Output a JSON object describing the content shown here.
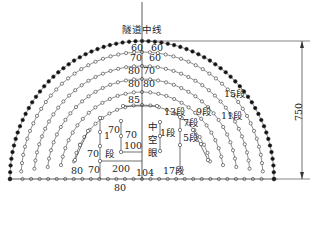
{
  "diagram": {
    "title": "隧道中线",
    "dimension_height": "750",
    "bottom_spacing": "80",
    "arc_spacings": [
      {
        "left": "60",
        "right": "60"
      },
      {
        "left": "70",
        "right": "60"
      },
      {
        "left": "80",
        "right": "70"
      },
      {
        "left": "80",
        "right": "80"
      },
      {
        "left": "85",
        "right": ""
      }
    ],
    "cut_labels": {
      "seg1": "1",
      "seg1_unit": "段",
      "v70a": "70",
      "v70b": "70",
      "v70c": "70",
      "v100": "100",
      "v200": "200",
      "v104": "104",
      "v80": "80",
      "v70d": "70",
      "empty_hole": [
        "中",
        "空",
        "眼"
      ],
      "seg1b": "1段",
      "seg7": "7段",
      "seg5": "5段",
      "seg17": "17段",
      "seg13": "13段",
      "seg9": "9段",
      "seg11": "11段",
      "seg15": "15段"
    }
  }
}
